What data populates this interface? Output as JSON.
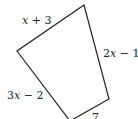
{
  "diagram": {
    "type": "quadrilateral",
    "vertices": [
      {
        "name": "top",
        "x": 84,
        "y": 5
      },
      {
        "name": "left",
        "x": 17,
        "y": 51
      },
      {
        "name": "bottom",
        "x": 70,
        "y": 121
      },
      {
        "name": "right",
        "x": 109,
        "y": 99
      }
    ],
    "sides": [
      {
        "id": "top-left",
        "var": "x",
        "rest": " + 3"
      },
      {
        "id": "right",
        "coef": "2",
        "var": "x",
        "rest": " − 1"
      },
      {
        "id": "bottom-left",
        "coef": "3",
        "var": "x",
        "rest": " − 2"
      },
      {
        "id": "bottom-right",
        "value": "7"
      }
    ],
    "stroke_color": "#222222"
  }
}
